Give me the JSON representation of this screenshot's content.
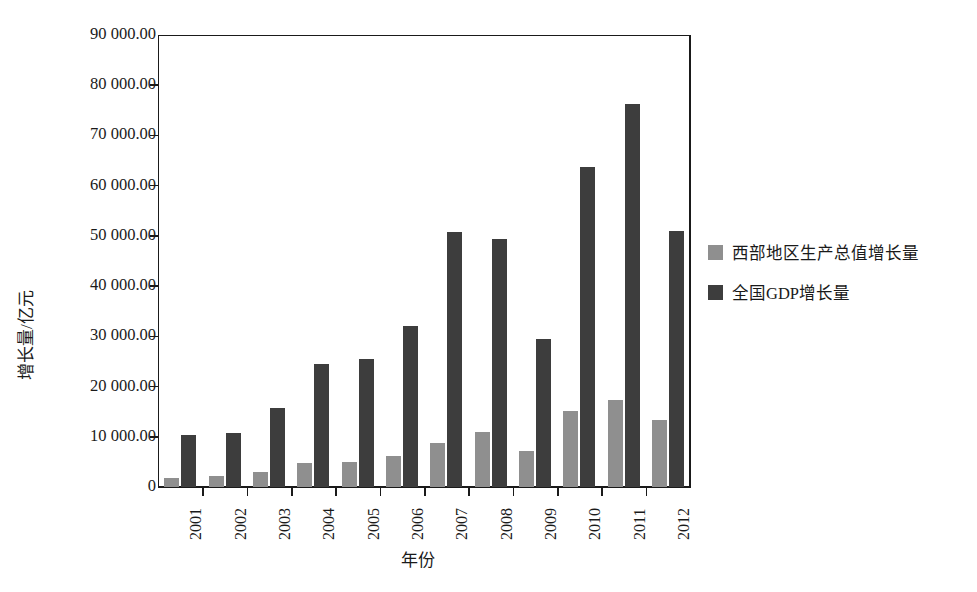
{
  "chart_data": {
    "type": "bar",
    "title": "",
    "xlabel": "年份",
    "ylabel": "增长量/亿元",
    "ylim": [
      0,
      90000
    ],
    "ytick_values": [
      0,
      10000,
      20000,
      30000,
      40000,
      50000,
      60000,
      70000,
      80000,
      90000
    ],
    "ytick_labels": [
      "0",
      "10 000.00",
      "20 000.00",
      "30 000.00",
      "40 000.00",
      "50 000.00",
      "60 000.00",
      "70 000.00",
      "80 000.00",
      "90 000.00"
    ],
    "grid": false,
    "legend_position": "right",
    "categories": [
      "2001",
      "2002",
      "2003",
      "2004",
      "2005",
      "2006",
      "2007",
      "2008",
      "2009",
      "2010",
      "2011",
      "2012"
    ],
    "series": [
      {
        "name": "西部地区生产总值增长量",
        "color": "#8f8f8f",
        "values": [
          1700,
          2200,
          2900,
          4800,
          5000,
          6100,
          8700,
          10900,
          7100,
          15200,
          17400,
          13400
        ]
      },
      {
        "name": "全国GDP增长量",
        "color": "#3d3d3d",
        "values": [
          10350,
          10700,
          15700,
          24400,
          25400,
          32100,
          50800,
          49300,
          29500,
          63700,
          76200,
          51000
        ]
      }
    ]
  },
  "legend": {
    "items": [
      {
        "label": "西部地区生产总值增长量",
        "color": "#8f8f8f"
      },
      {
        "label": "全国GDP增长量",
        "color": "#3d3d3d"
      }
    ]
  }
}
